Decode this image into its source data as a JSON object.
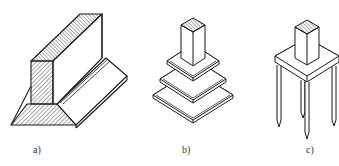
{
  "figure": {
    "panels": [
      {
        "id": "a",
        "label": "a)",
        "depicts": "strip footing under wall (hatched section)"
      },
      {
        "id": "b",
        "label": "b)",
        "depicts": "stepped isolated column footing"
      },
      {
        "id": "c",
        "label": "c)",
        "depicts": "pile cap with column on four piles"
      }
    ]
  },
  "colors": {
    "line": "#1a1a1a",
    "background": "#ffffff",
    "label": "#333333"
  }
}
